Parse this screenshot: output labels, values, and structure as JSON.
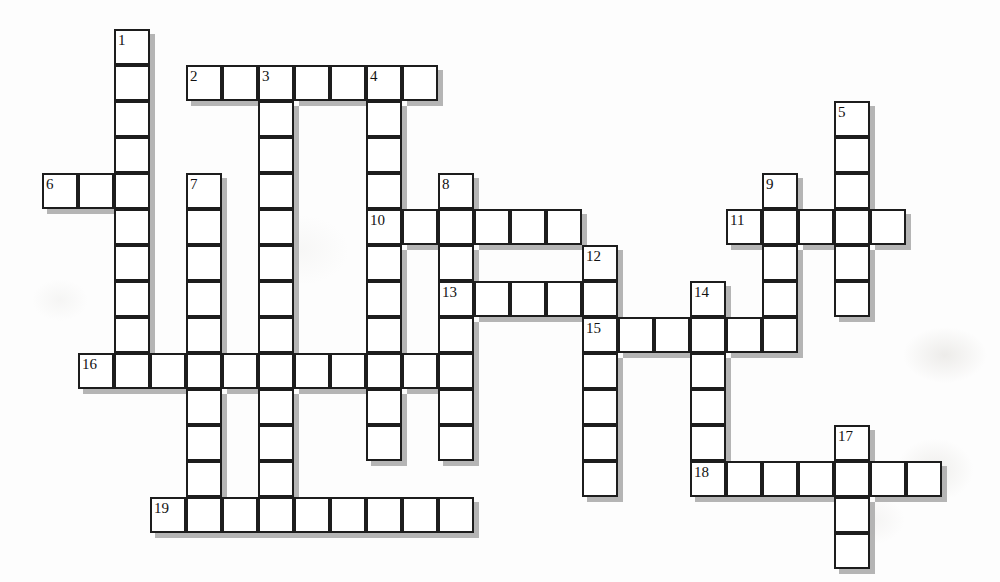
{
  "puzzle": {
    "title": "Crossword Puzzle Grid",
    "type": "crossword",
    "cell_size": 36,
    "origin": {
      "x": 42,
      "y": 29
    },
    "grid_columns": 26,
    "grid_rows": 15,
    "colors": {
      "cell_fill": "#ffffff",
      "cell_border": "#1d1d1d",
      "shadow": "#a8a8a8",
      "number_text": "#111111",
      "page_background": "#fdfdfd"
    },
    "entries": [
      {
        "number": "1",
        "direction": "down",
        "col": 2,
        "row": 0,
        "length": 10
      },
      {
        "number": "2",
        "direction": "across",
        "col": 4,
        "row": 1,
        "length": 7
      },
      {
        "number": "3",
        "direction": "down",
        "col": 6,
        "row": 1,
        "length": 12
      },
      {
        "number": "4",
        "direction": "down",
        "col": 9,
        "row": 1,
        "length": 11
      },
      {
        "number": "5",
        "direction": "down",
        "col": 22,
        "row": 2,
        "length": 6
      },
      {
        "number": "6",
        "direction": "across",
        "col": 0,
        "row": 4,
        "length": 3
      },
      {
        "number": "7",
        "direction": "down",
        "col": 4,
        "row": 4,
        "length": 10
      },
      {
        "number": "8",
        "direction": "down",
        "col": 11,
        "row": 4,
        "length": 8
      },
      {
        "number": "9",
        "direction": "down",
        "col": 20,
        "row": 4,
        "length": 5
      },
      {
        "number": "10",
        "direction": "across",
        "col": 9,
        "row": 5,
        "length": 6
      },
      {
        "number": "11",
        "direction": "across",
        "col": 19,
        "row": 5,
        "length": 5
      },
      {
        "number": "12",
        "direction": "down",
        "col": 15,
        "row": 6,
        "length": 7
      },
      {
        "number": "13",
        "direction": "across",
        "col": 11,
        "row": 7,
        "length": 5
      },
      {
        "number": "14",
        "direction": "down",
        "col": 18,
        "row": 7,
        "length": 6
      },
      {
        "number": "15",
        "direction": "across",
        "col": 15,
        "row": 8,
        "length": 6
      },
      {
        "number": "16",
        "direction": "across",
        "col": 1,
        "row": 9,
        "length": 11
      },
      {
        "number": "17",
        "direction": "down",
        "col": 22,
        "row": 11,
        "length": 4
      },
      {
        "number": "18",
        "direction": "across",
        "col": 18,
        "row": 12,
        "length": 7
      },
      {
        "number": "19",
        "direction": "across",
        "col": 3,
        "row": 13,
        "length": 9
      }
    ],
    "numbered_cells": [
      {
        "label": "1",
        "col": 2,
        "row": 0
      },
      {
        "label": "2",
        "col": 4,
        "row": 1
      },
      {
        "label": "3",
        "col": 6,
        "row": 1
      },
      {
        "label": "4",
        "col": 9,
        "row": 1
      },
      {
        "label": "5",
        "col": 22,
        "row": 2
      },
      {
        "label": "6",
        "col": 0,
        "row": 4
      },
      {
        "label": "7",
        "col": 4,
        "row": 4
      },
      {
        "label": "8",
        "col": 11,
        "row": 4
      },
      {
        "label": "9",
        "col": 20,
        "row": 4
      },
      {
        "label": "10",
        "col": 9,
        "row": 5
      },
      {
        "label": "11",
        "col": 19,
        "row": 5
      },
      {
        "label": "12",
        "col": 15,
        "row": 6
      },
      {
        "label": "13",
        "col": 11,
        "row": 7
      },
      {
        "label": "14",
        "col": 18,
        "row": 7
      },
      {
        "label": "15",
        "col": 15,
        "row": 8
      },
      {
        "label": "16",
        "col": 1,
        "row": 9
      },
      {
        "label": "17",
        "col": 22,
        "row": 11
      },
      {
        "label": "18",
        "col": 18,
        "row": 12
      },
      {
        "label": "19",
        "col": 3,
        "row": 13
      }
    ]
  }
}
